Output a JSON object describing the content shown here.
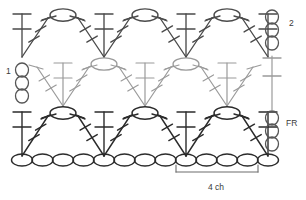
{
  "chart_data": {
    "type": "diagram",
    "subtitle": "Shell / fan stitch repeat worked over a foundation chain",
    "xlabel": "",
    "ylabel": "",
    "grid": false,
    "legend_position": "none",
    "annotations": [
      {
        "id": "row-label-2",
        "text": "2",
        "x": 289,
        "y": 26,
        "anchor": "start",
        "font_size": 8.5
      },
      {
        "id": "row-label-1",
        "text": "1",
        "x": 6,
        "y": 74,
        "anchor": "start",
        "font_size": 8.5
      },
      {
        "id": "row-label-fr",
        "text": "FR",
        "x": 286,
        "y": 126,
        "anchor": "start",
        "font_size": 8.5
      },
      {
        "id": "measure-4ch",
        "text": "4 ch",
        "x": 216,
        "y": 190,
        "anchor": "middle",
        "font_size": 8.5
      }
    ],
    "colors": {
      "row_top": "#4a4a4a",
      "row_middle": "#9a9a9a",
      "row_bottom": "#2b2b2b",
      "chain_row": "#2b2b2b",
      "edge_chain": "#555555",
      "bracket": "#6d6d6d",
      "text": "#3a3a3a",
      "background": "#ffffff"
    },
    "rows": [
      {
        "id": "row-2",
        "label": "2",
        "y_top": 14,
        "y_base": 57,
        "color": "#4a4a4a",
        "stroke_width": 1.35,
        "fans": [
          {
            "id": "fan-top-0",
            "apex_x": 22,
            "partial": true,
            "half": "right",
            "spread": 26
          },
          {
            "id": "fan-top-1",
            "apex_x": 104,
            "partial": false,
            "half": "both",
            "spread": 26
          },
          {
            "id": "fan-top-2",
            "apex_x": 186,
            "partial": false,
            "half": "both",
            "spread": 26
          },
          {
            "id": "fan-top-3",
            "apex_x": 268,
            "partial": true,
            "half": "left",
            "spread": 26
          }
        ],
        "chain_ovals": [
          {
            "id": "oval-top-0",
            "cx": 63,
            "cy": 15
          },
          {
            "id": "oval-top-1",
            "cx": 145,
            "cy": 15
          },
          {
            "id": "oval-top-2",
            "cx": 227,
            "cy": 15
          }
        ]
      },
      {
        "id": "row-middle",
        "label": "",
        "y_top": 63,
        "y_base": 106,
        "color": "#9a9a9a",
        "stroke_width": 1.2,
        "fans": [
          {
            "id": "fan-mid-0",
            "apex_x": 63,
            "partial": false,
            "half": "both",
            "spread": 26
          },
          {
            "id": "fan-mid-1",
            "apex_x": 145,
            "partial": false,
            "half": "both",
            "spread": 26
          },
          {
            "id": "fan-mid-2",
            "apex_x": 227,
            "partial": false,
            "half": "both",
            "spread": 26
          }
        ],
        "chain_ovals": [
          {
            "id": "oval-mid-0",
            "cx": 104,
            "cy": 64
          },
          {
            "id": "oval-mid-1",
            "cx": 186,
            "cy": 64
          }
        ]
      },
      {
        "id": "row-1",
        "label": "1",
        "y_top": 112,
        "y_base": 156,
        "color": "#2b2b2b",
        "stroke_width": 1.4,
        "fans": [
          {
            "id": "fan-bot-0",
            "apex_x": 22,
            "partial": true,
            "half": "right",
            "spread": 26
          },
          {
            "id": "fan-bot-1",
            "apex_x": 104,
            "partial": false,
            "half": "both",
            "spread": 26
          },
          {
            "id": "fan-bot-2",
            "apex_x": 186,
            "partial": false,
            "half": "both",
            "spread": 26
          },
          {
            "id": "fan-bot-3",
            "apex_x": 268,
            "partial": true,
            "half": "left",
            "spread": 26
          }
        ],
        "chain_ovals": [
          {
            "id": "oval-bot-0",
            "cx": 63,
            "cy": 113
          },
          {
            "id": "oval-bot-1",
            "cx": 145,
            "cy": 113
          },
          {
            "id": "oval-bot-2",
            "cx": 227,
            "cy": 113
          }
        ]
      }
    ],
    "foundation_chain": {
      "id": "foundation-chain-row",
      "label": "FR",
      "y": 160,
      "count": 13,
      "start_x": 22,
      "spacing": 20.5,
      "rx": 10.5,
      "ry": 6.0,
      "color": "#2b2b2b"
    },
    "edge_chains": [
      {
        "id": "edge-chain-left",
        "side": "left",
        "x": 22,
        "ovals": [
          {
            "cy": 70
          },
          {
            "cy": 83
          },
          {
            "cy": 96
          }
        ],
        "rx": 6.5,
        "ry": 7.0,
        "color": "#555555"
      },
      {
        "id": "edge-chain-right-top",
        "side": "right",
        "x": 272,
        "ovals": [
          {
            "cy": 17
          },
          {
            "cy": 30
          },
          {
            "cy": 43
          }
        ],
        "rx": 6.5,
        "ry": 7.0,
        "color": "#555555"
      },
      {
        "id": "edge-chain-right-bottom",
        "side": "right",
        "x": 272,
        "ovals": [
          {
            "cy": 118
          },
          {
            "cy": 131
          },
          {
            "cy": 144
          }
        ],
        "rx": 6.5,
        "ry": 7.0,
        "color": "#555555"
      }
    ],
    "edge_posts": [
      {
        "id": "edge-post-right-middle",
        "x": 272,
        "y1": 56,
        "y2": 110,
        "bars": [
          58,
          76
        ],
        "bar_half_width": 9,
        "color": "#9a9a9a"
      }
    ],
    "measure_bracket": {
      "id": "bracket-4ch",
      "x1": 176,
      "x2": 258,
      "y": 172,
      "tick_height": 7,
      "label": "4 ch",
      "color": "#6d6d6d"
    },
    "notes": {
      "stitch_symbols": "oval = chain stitch (ch); vertical line with cross-bars = double crochet post; converging group = shell/fan",
      "rows_shown": 3,
      "foundation_row_label": "FR",
      "repeat_width_chains": 4
    }
  }
}
